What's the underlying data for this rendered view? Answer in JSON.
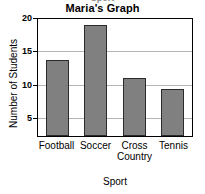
{
  "chart_data": {
    "type": "bar",
    "title": "Maria's Graph",
    "xlabel": "Sport",
    "ylabel": "Number of Students",
    "categories": [
      "Football",
      "Soccer",
      "Cross Country",
      "Tennis"
    ],
    "category_lines": [
      [
        "Football"
      ],
      [
        "Soccer"
      ],
      [
        "Cross",
        "Country"
      ],
      [
        "Tennis"
      ]
    ],
    "values": [
      13,
      19,
      10,
      8
    ],
    "ylim": [
      0,
      20
    ],
    "yticks": [
      20,
      15,
      10,
      5
    ],
    "ytick_labels": [
      "20",
      "15",
      "10",
      "5"
    ],
    "grid": true,
    "grid_axis": "y",
    "legend": false,
    "colors": {
      "bar_fill": "#808080",
      "bar_outline": "#2b2b2b",
      "grid": "#b4b4b4",
      "frame": "#000000",
      "text": "#000000",
      "background": "#ffffff"
    }
  },
  "header": {
    "clipped_text": "Sport"
  }
}
